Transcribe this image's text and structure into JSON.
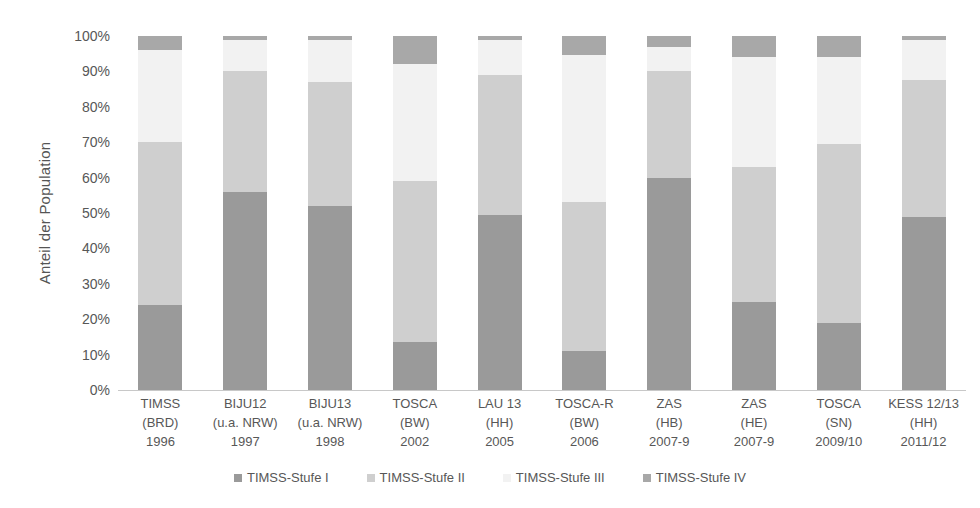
{
  "chart_data": {
    "type": "bar",
    "subtype": "stacked-100-percent",
    "title": "",
    "xlabel": "",
    "ylabel": "Anteil der Population",
    "ylim": [
      0,
      100
    ],
    "ytick_labels": [
      "100%",
      "90%",
      "80%",
      "70%",
      "60%",
      "50%",
      "40%",
      "30%",
      "20%",
      "10%",
      "0%"
    ],
    "ytick_values": [
      100,
      90,
      80,
      70,
      60,
      50,
      40,
      30,
      20,
      10,
      0
    ],
    "grid": false,
    "legend_position": "bottom",
    "categories": [
      "TIMSS (BRD) 1996",
      "BIJU12 (u.a. NRW) 1997",
      "BIJU13 (u.a. NRW) 1998",
      "TOSCA (BW) 2002",
      "LAU 13 (HH) 2005",
      "TOSCA-R (BW) 2006",
      "ZAS (HB) 2007-9",
      "ZAS (HE) 2007-9",
      "TOSCA (SN) 2009/10",
      "KESS 12/13 (HH) 2011/12"
    ],
    "category_lines": [
      {
        "line1": "TIMSS",
        "line2": "(BRD)",
        "line3": "1996"
      },
      {
        "line1": "BIJU12",
        "line2": "(u.a. NRW)",
        "line3": "1997"
      },
      {
        "line1": "BIJU13",
        "line2": "(u.a. NRW)",
        "line3": "1998"
      },
      {
        "line1": "TOSCA",
        "line2": "(BW)",
        "line3": "2002"
      },
      {
        "line1": "LAU 13",
        "line2": "(HH)",
        "line3": "2005"
      },
      {
        "line1": "TOSCA-R",
        "line2": "(BW)",
        "line3": "2006"
      },
      {
        "line1": "ZAS",
        "line2": "(HB)",
        "line3": "2007-9"
      },
      {
        "line1": "ZAS",
        "line2": "(HE)",
        "line3": "2007-9"
      },
      {
        "line1": "TOSCA",
        "line2": "(SN)",
        "line3": "2009/10"
      },
      {
        "line1": "KESS 12/13",
        "line2": "(HH)",
        "line3": "2011/12"
      }
    ],
    "series": [
      {
        "name": "TIMSS-Stufe I",
        "color": "#9a9a9a",
        "values": [
          24,
          56,
          52,
          13.5,
          49.5,
          11,
          60,
          25,
          19,
          49
        ]
      },
      {
        "name": "TIMSS-Stufe II",
        "color": "#cfcfcf",
        "values": [
          46,
          34,
          35,
          45.5,
          39.5,
          42,
          30,
          38,
          50.5,
          38.5
        ]
      },
      {
        "name": "TIMSS-Stufe III",
        "color": "#f2f2f2",
        "values": [
          26,
          9,
          12,
          33,
          10,
          41.5,
          7,
          31,
          24.5,
          11.5
        ]
      },
      {
        "name": "TIMSS-Stufe IV",
        "color": "#a8a8a8",
        "values": [
          4,
          1,
          1,
          8,
          1,
          5.5,
          3,
          6,
          6,
          1
        ]
      }
    ]
  },
  "legend": {
    "items": [
      {
        "label": "TIMSS-Stufe I",
        "color": "#9a9a9a"
      },
      {
        "label": "TIMSS-Stufe II",
        "color": "#cfcfcf"
      },
      {
        "label": "TIMSS-Stufe III",
        "color": "#f2f2f2"
      },
      {
        "label": "TIMSS-Stufe IV",
        "color": "#a8a8a8"
      }
    ]
  },
  "axis": {
    "y_title": "Anteil der Population"
  },
  "colors": {
    "stufe_i": "#9a9a9a",
    "stufe_ii": "#cfcfcf",
    "stufe_iii": "#f2f2f2",
    "stufe_iv": "#a8a8a8",
    "text": "#575757",
    "axis_line": "#c8c8c8",
    "background": "#ffffff"
  }
}
